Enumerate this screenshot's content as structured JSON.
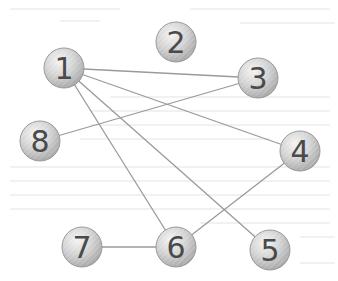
{
  "graph": {
    "nodes": [
      {
        "id": "1",
        "label": "1",
        "x": 64,
        "y": 68
      },
      {
        "id": "2",
        "label": "2",
        "x": 176,
        "y": 42
      },
      {
        "id": "3",
        "label": "3",
        "x": 258,
        "y": 78
      },
      {
        "id": "4",
        "label": "4",
        "x": 300,
        "y": 151
      },
      {
        "id": "5",
        "label": "5",
        "x": 270,
        "y": 250
      },
      {
        "id": "6",
        "label": "6",
        "x": 176,
        "y": 247
      },
      {
        "id": "7",
        "label": "7",
        "x": 82,
        "y": 247
      },
      {
        "id": "8",
        "label": "8",
        "x": 40,
        "y": 141
      }
    ],
    "edges": [
      {
        "from": "1",
        "to": "3"
      },
      {
        "from": "1",
        "to": "4"
      },
      {
        "from": "1",
        "to": "5"
      },
      {
        "from": "1",
        "to": "6"
      },
      {
        "from": "8",
        "to": "3"
      },
      {
        "from": "7",
        "to": "6"
      },
      {
        "from": "6",
        "to": "4"
      }
    ],
    "node_radius": 20,
    "colors": {
      "node_fill": "#d6d6d6",
      "node_stroke": "#9c9c9c",
      "edge": "#9a9a9a",
      "label": "#4a4a4a"
    }
  }
}
